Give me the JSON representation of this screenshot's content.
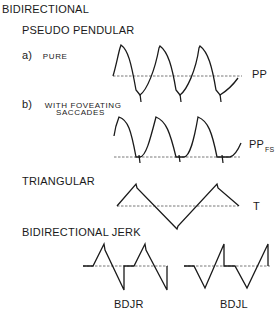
{
  "diagram": {
    "title": "BIDIRECTIONAL",
    "sections": {
      "pseudo_pendular": {
        "heading": "PSEUDO PENDULAR",
        "pure": {
          "marker": "a)",
          "label": "PURE",
          "waveform_label": "PP"
        },
        "foveating": {
          "marker": "b)",
          "label_line1": "WITH FOVEATING",
          "label_line2": "SACCADES",
          "waveform_label": "PP",
          "waveform_label_sub": "FS"
        }
      },
      "triangular": {
        "heading": "TRIANGULAR",
        "waveform_label": "T"
      },
      "bidirectional_jerk": {
        "heading": "BIDIRECTIONAL JERK",
        "right": {
          "waveform_label": "BDJR"
        },
        "left": {
          "waveform_label": "BDJL"
        }
      }
    }
  }
}
